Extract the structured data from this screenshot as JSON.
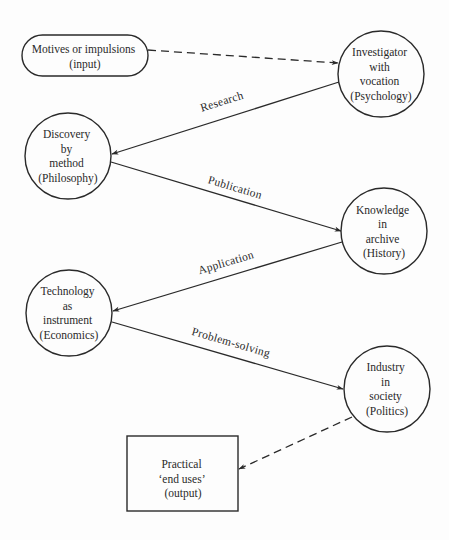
{
  "diagram": {
    "type": "flow",
    "nodes": [
      {
        "id": "motives",
        "shape": "pill",
        "lines": [
          "Motives or impulsions",
          "(input)"
        ]
      },
      {
        "id": "investigator",
        "shape": "circle",
        "lines": [
          "Investigator",
          "with",
          "vocation",
          "(Psychology)"
        ]
      },
      {
        "id": "discovery",
        "shape": "circle",
        "lines": [
          "Discovery",
          "by",
          "method",
          "(Philosophy)"
        ]
      },
      {
        "id": "knowledge",
        "shape": "circle",
        "lines": [
          "Knowledge",
          "in",
          "archive",
          "(History)"
        ]
      },
      {
        "id": "technology",
        "shape": "circle",
        "lines": [
          "Technology",
          "as",
          "instrument",
          "(Economics)"
        ]
      },
      {
        "id": "industry",
        "shape": "circle",
        "lines": [
          "Industry",
          "in",
          "society",
          "(Politics)"
        ]
      },
      {
        "id": "practical",
        "shape": "rectangle",
        "lines": [
          "Practical",
          "‘end uses’",
          "(output)"
        ]
      }
    ],
    "edges": [
      {
        "from": "motives",
        "to": "investigator",
        "style": "dashed",
        "label": ""
      },
      {
        "from": "investigator",
        "to": "discovery",
        "style": "solid",
        "label": "Research"
      },
      {
        "from": "discovery",
        "to": "knowledge",
        "style": "solid",
        "label": "Publication"
      },
      {
        "from": "knowledge",
        "to": "technology",
        "style": "solid",
        "label": "Application"
      },
      {
        "from": "technology",
        "to": "industry",
        "style": "solid",
        "label": "Problem-solving"
      },
      {
        "from": "industry",
        "to": "practical",
        "style": "dashed",
        "label": ""
      }
    ]
  }
}
